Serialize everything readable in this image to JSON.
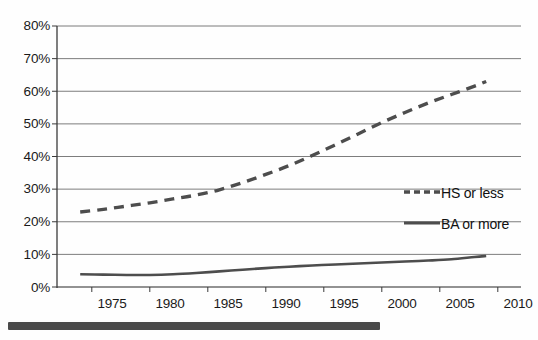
{
  "chart_data": {
    "type": "line",
    "title": "",
    "subtitle": "",
    "xlabel": "",
    "ylabel": "",
    "xlim": [
      1972,
      2012
    ],
    "ylim": [
      0,
      0.8
    ],
    "grid": true,
    "grid_axis": "y",
    "legend_position": "center-right",
    "y_tick_labels": [
      "0%",
      "10%",
      "20%",
      "30%",
      "40%",
      "50%",
      "60%",
      "70%",
      "80%"
    ],
    "y_tick_values": [
      0,
      10,
      20,
      30,
      40,
      50,
      60,
      70,
      80
    ],
    "x_tick_labels": [
      "1975",
      "1980",
      "1985",
      "1990",
      "1995",
      "2000",
      "2005",
      "2010"
    ],
    "x_tick_values": [
      1975,
      1980,
      1985,
      1990,
      1995,
      2000,
      2005,
      2010
    ],
    "x": [
      1974,
      1976,
      1978,
      1980,
      1982,
      1984,
      1986,
      1988,
      1990,
      1992,
      1994,
      1996,
      1998,
      2000,
      2002,
      2004,
      2006,
      2008,
      2009
    ],
    "series": [
      {
        "name": "HS or less",
        "style": "dashed",
        "color": "#4d4d4d",
        "values": [
          23.0,
          23.8,
          24.8,
          25.8,
          27.0,
          28.2,
          29.8,
          32.0,
          34.5,
          37.2,
          40.3,
          43.6,
          47.0,
          50.4,
          53.5,
          56.4,
          59.0,
          61.6,
          63.0
        ]
      },
      {
        "name": "BA or more",
        "style": "solid",
        "color": "#4d4d4d",
        "values": [
          3.9,
          3.8,
          3.7,
          3.7,
          3.9,
          4.3,
          4.8,
          5.3,
          5.8,
          6.2,
          6.6,
          6.9,
          7.2,
          7.5,
          7.8,
          8.1,
          8.5,
          9.2,
          9.5
        ]
      }
    ],
    "legend": [
      {
        "label": "HS or less",
        "style": "dashed"
      },
      {
        "label": "BA or more",
        "style": "solid"
      }
    ],
    "annotations": [
      {
        "name": "bottom-redaction-bar",
        "description": "thick dark horizontal bar at bottom of scanned page"
      }
    ]
  },
  "axes": {
    "y_ticks": [
      {
        "label": "80%",
        "value": 80
      },
      {
        "label": "70%",
        "value": 70
      },
      {
        "label": "60%",
        "value": 60
      },
      {
        "label": "50%",
        "value": 50
      },
      {
        "label": "40%",
        "value": 40
      },
      {
        "label": "30%",
        "value": 30
      },
      {
        "label": "20%",
        "value": 20
      },
      {
        "label": "10%",
        "value": 10
      },
      {
        "label": "0%",
        "value": 0
      }
    ],
    "x_ticks": [
      {
        "label": "1975",
        "value": 1975
      },
      {
        "label": "1980",
        "value": 1980
      },
      {
        "label": "1985",
        "value": 1985
      },
      {
        "label": "1990",
        "value": 1990
      },
      {
        "label": "1995",
        "value": 1995
      },
      {
        "label": "2000",
        "value": 2000
      },
      {
        "label": "2005",
        "value": 2005
      },
      {
        "label": "2010",
        "value": 2010
      }
    ]
  },
  "legend": {
    "items": [
      {
        "label": "HS or less"
      },
      {
        "label": "BA or more"
      }
    ]
  },
  "colors": {
    "line": "#4d4d4d",
    "grid": "#6e6e6e",
    "axis": "#3a3a3a",
    "text": "#1a1a1a",
    "bar": "#4a4a4a",
    "background": "#fefefe"
  }
}
